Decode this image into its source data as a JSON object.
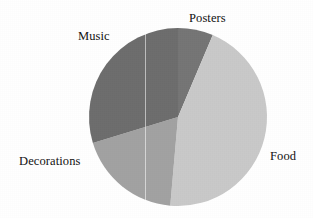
{
  "chart_data": {
    "type": "pie",
    "title": "",
    "labels": [
      "Posters",
      "Food",
      "Decorations",
      "Music"
    ],
    "values": [
      6.4,
      45.0,
      18.9,
      29.7
    ],
    "unit": "percent",
    "legend": "none",
    "label_placement": "outside-callout",
    "start_angle_deg": 0,
    "direction": "clockwise",
    "slices": [
      {
        "label": "Posters",
        "value": 6.4,
        "start_deg": 0,
        "end_deg": 23,
        "color": "#757575"
      },
      {
        "label": "Food",
        "value": 45.0,
        "start_deg": 23,
        "end_deg": 185,
        "color": "#c9c9c9"
      },
      {
        "label": "Decorations",
        "value": 18.9,
        "start_deg": 185,
        "end_deg": 253,
        "color": "#a2a2a2"
      },
      {
        "label": "Music",
        "value": 29.7,
        "start_deg": 253,
        "end_deg": 360,
        "color": "#6d6d6d"
      }
    ],
    "geometry": {
      "center_x": 178,
      "center_y": 117,
      "radius": 89
    },
    "background": "#ffffff"
  },
  "labels": {
    "music": "Music",
    "posters": "Posters",
    "decorations": "Decorations",
    "food": "Food"
  }
}
